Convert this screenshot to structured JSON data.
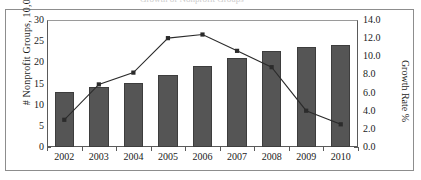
{
  "figure": {
    "top_sliver_text": "Growth of Nonprofit Groups",
    "background_color": "#ffffff",
    "frame_color": "#8d8d8d"
  },
  "axes": {
    "left": {
      "title": "# Nonprofit Groups, 10,000",
      "ticks": [
        "30",
        "25",
        "20",
        "15",
        "10",
        "5",
        "0"
      ],
      "min": 0,
      "max": 30
    },
    "right": {
      "title": "Growth Rate %",
      "ticks": [
        "14.0",
        "12.0",
        "10.0",
        "8.0",
        "6.0",
        "4.0",
        "2.0",
        "0.0"
      ],
      "min": 0,
      "max": 14
    }
  },
  "chart_data": {
    "type": "bar",
    "title": "",
    "xlabel": "",
    "ylabel": "# Nonprofit Groups, 10,000",
    "y2label": "Growth Rate %",
    "ylim": [
      0,
      30
    ],
    "y2lim": [
      0,
      14
    ],
    "grid": false,
    "legend": "none",
    "categories": [
      "2002",
      "2003",
      "2004",
      "2005",
      "2006",
      "2007",
      "2008",
      "2009",
      "2010"
    ],
    "series": [
      {
        "name": "# Nonprofit Groups, 10,000",
        "type": "bar",
        "axis": "left",
        "color": "#555555",
        "values": [
          13.1,
          14.2,
          15.2,
          17.0,
          19.1,
          21.0,
          22.7,
          23.7,
          24.2
        ]
      },
      {
        "name": "Growth Rate %",
        "type": "line",
        "axis": "right",
        "color": "#2b2b2b",
        "marker": "square",
        "values": [
          3.0,
          6.9,
          8.2,
          12.0,
          12.4,
          10.6,
          8.8,
          4.0,
          2.5
        ]
      }
    ]
  }
}
